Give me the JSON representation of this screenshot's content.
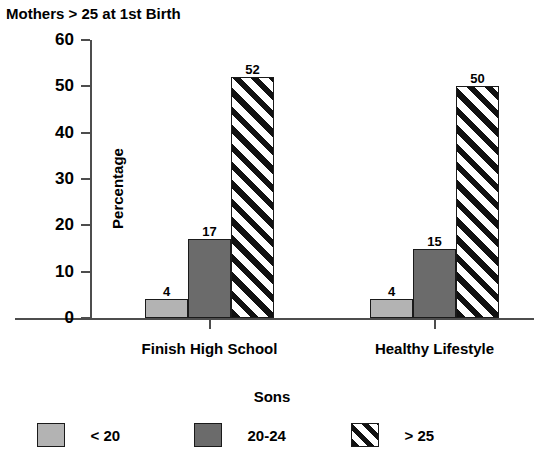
{
  "chart_data": {
    "type": "bar",
    "title": "Mothers > 25 at 1st Birth",
    "xlabel": "Sons",
    "ylabel": "Percentage",
    "categories": [
      "Finish High School",
      "Healthy Lifestyle"
    ],
    "series": [
      {
        "name": "< 20",
        "values": [
          4,
          4
        ],
        "color": "#b3b3b3",
        "pattern": "solid"
      },
      {
        "name": "20-24",
        "values": [
          17,
          15
        ],
        "color": "#6b6b6b",
        "pattern": "solid"
      },
      {
        "name": "> 25",
        "values": [
          52,
          50
        ],
        "color": "#ffffff",
        "pattern": "diagonal-hatch"
      }
    ],
    "ylim": [
      0,
      60
    ],
    "yticks": [
      0,
      10,
      20,
      30,
      40,
      50,
      60
    ],
    "ytick_labels": [
      "0",
      "10",
      "20",
      "30",
      "40",
      "50",
      "60"
    ],
    "data_labels": [
      [
        4,
        17,
        52
      ],
      [
        4,
        15,
        50
      ]
    ],
    "grid": false,
    "legend_position": "bottom",
    "legend_entries": [
      "< 20",
      "20-24",
      "> 25"
    ]
  },
  "axis": {
    "y_title": "Percentage",
    "x_title": "Sons"
  }
}
